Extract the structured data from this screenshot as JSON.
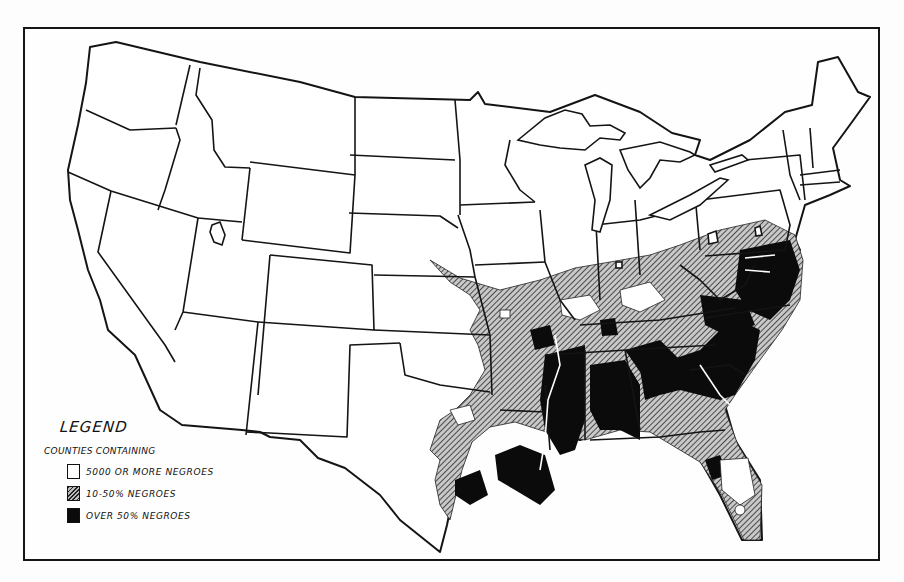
{
  "map": {
    "subject": "Counties of the United States by Negro population",
    "region": "Contiguous United States",
    "style": "black-and-white choropleth with state outlines"
  },
  "legend": {
    "title": "LEGEND",
    "subtitle": "COUNTIES CONTAINING",
    "items": [
      {
        "label": "5000 OR MORE NEGROES",
        "pattern": "white-outline",
        "color": "#ffffff"
      },
      {
        "label": "10-50% NEGROES",
        "pattern": "hatched",
        "color": "#8a8a8a"
      },
      {
        "label": "OVER 50% NEGROES",
        "pattern": "solid-black",
        "color": "#0b0b0b"
      }
    ]
  },
  "colors": {
    "background": "#fefefe",
    "outline": "#151515",
    "hatch_fill": "#8a8a8a",
    "black_fill": "#0b0b0b"
  }
}
